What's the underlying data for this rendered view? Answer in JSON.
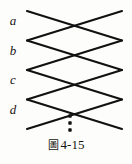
{
  "figure": {
    "caption_mark": "圖",
    "caption_number": "4-15",
    "caption_full": "圖 4-15",
    "row_labels": [
      "a",
      "b",
      "c",
      "d"
    ],
    "ellipsis_symbol": "⋮",
    "line_color": "#111111",
    "background_color": "#fdfdfc",
    "label_color": "#16140f"
  },
  "chart_data": {
    "type": "diagram",
    "categories": [
      "a",
      "b",
      "c",
      "d"
    ],
    "geometry": {
      "x_left": 27,
      "x_right": 122,
      "x_cross": 74,
      "unit_height": 29.5,
      "row_tops": [
        11,
        40.5,
        70,
        99.5
      ],
      "row_bottoms": [
        40.5,
        70,
        99.5,
        129
      ],
      "line_width": 2.1
    },
    "segments": [
      {
        "row": "a",
        "from": [
          27,
          11
        ],
        "to": [
          122,
          40.5
        ],
        "slope": "down"
      },
      {
        "row": "a",
        "from": [
          27,
          40.5
        ],
        "to": [
          122,
          11
        ],
        "slope": "up"
      },
      {
        "row": "b",
        "from": [
          27,
          40.5
        ],
        "to": [
          122,
          70
        ],
        "slope": "down"
      },
      {
        "row": "b",
        "from": [
          27,
          70
        ],
        "to": [
          122,
          40.5
        ],
        "slope": "up"
      },
      {
        "row": "c",
        "from": [
          27,
          70
        ],
        "to": [
          122,
          99.5
        ],
        "slope": "down"
      },
      {
        "row": "c",
        "from": [
          27,
          99.5
        ],
        "to": [
          122,
          70
        ],
        "slope": "up"
      },
      {
        "row": "d",
        "from": [
          27,
          99.5
        ],
        "to": [
          122,
          129
        ],
        "slope": "down"
      },
      {
        "row": "d",
        "from": [
          27,
          129
        ],
        "to": [
          122,
          99.5
        ],
        "slope": "up"
      }
    ],
    "ellipsis": {
      "x": 70,
      "dots_y": [
        116,
        123,
        130
      ],
      "count": 3
    },
    "grid": false,
    "legend": null
  }
}
